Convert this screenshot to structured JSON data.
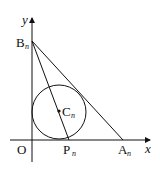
{
  "diagram": {
    "axes": {
      "x_label": "x",
      "y_label": "y",
      "origin_label": "O"
    },
    "points": {
      "B": {
        "label": "B",
        "sub": "n"
      },
      "A": {
        "label": "A",
        "sub": "n"
      },
      "P": {
        "label": "P",
        "sub": "n"
      },
      "C": {
        "label": "C",
        "sub": "n"
      }
    },
    "colors": {
      "stroke": "#111111",
      "background": "#ffffff"
    }
  }
}
